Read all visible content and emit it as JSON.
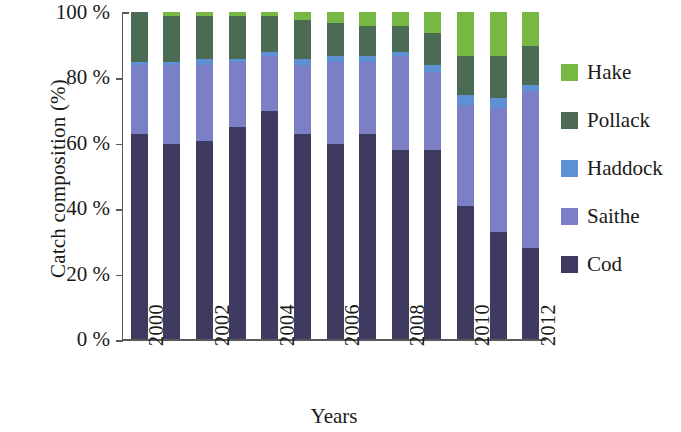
{
  "chart_data": {
    "type": "bar",
    "subtype": "stacked-percentage",
    "title": "",
    "xlabel": "Years",
    "ylabel": "Catch composition (%)",
    "categories": [
      "2000",
      "2001",
      "2002",
      "2003",
      "2004",
      "2005",
      "2006",
      "2007",
      "2008",
      "2009",
      "2010",
      "2011",
      "2012"
    ],
    "tick_labels_shown": [
      "2000",
      "2002",
      "2004",
      "2006",
      "2008",
      "2010",
      "2012"
    ],
    "ylim": [
      0,
      100
    ],
    "yticks": [
      0,
      20,
      40,
      60,
      80,
      100
    ],
    "ytick_labels": [
      "0 %",
      "20 %",
      "40 %",
      "60 %",
      "80 %",
      "100 %"
    ],
    "grid": false,
    "legend_position": "right",
    "stack_order_bottom_to_top": [
      "Cod",
      "Saithe",
      "Haddock",
      "Pollack",
      "Hake"
    ],
    "series": [
      {
        "name": "Cod",
        "color": "#3f3b60",
        "values": [
          63,
          60,
          61,
          65,
          70,
          63,
          60,
          63,
          58,
          58,
          41,
          33,
          28
        ]
      },
      {
        "name": "Saithe",
        "color": "#7b7fc6",
        "values": [
          21,
          24,
          23,
          20,
          17,
          21,
          25,
          22,
          29,
          24,
          31,
          38,
          48
        ]
      },
      {
        "name": "Haddock",
        "color": "#5e90d6",
        "values": [
          1,
          1,
          2,
          1,
          1,
          2,
          2,
          2,
          1,
          2,
          3,
          3,
          2
        ]
      },
      {
        "name": "Pollack",
        "color": "#4b6b55",
        "values": [
          15,
          14,
          13,
          13,
          11,
          12,
          10,
          9,
          8,
          10,
          12,
          13,
          12
        ]
      },
      {
        "name": "Hake",
        "color": "#77b845",
        "values": [
          0,
          1,
          1,
          1,
          1,
          2,
          3,
          4,
          4,
          6,
          13,
          13,
          10
        ]
      }
    ]
  },
  "legend": {
    "items": [
      {
        "label": "Hake",
        "color": "#77b845"
      },
      {
        "label": "Pollack",
        "color": "#4b6b55"
      },
      {
        "label": "Haddock",
        "color": "#5e90d6"
      },
      {
        "label": "Saithe",
        "color": "#7b7fc6"
      },
      {
        "label": "Cod",
        "color": "#3f3b60"
      }
    ]
  },
  "axis": {
    "line_color": "#5a5a5a"
  }
}
